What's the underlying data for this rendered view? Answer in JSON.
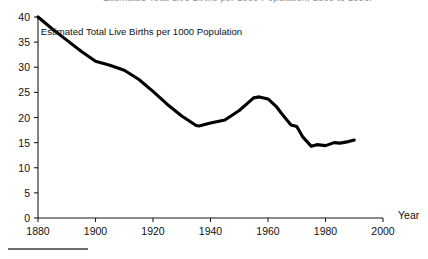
{
  "figure": {
    "clipped_title": "Estimated Total Live Births per 1000 Population, 1880 to 1990.",
    "annotation": "Estimated Total Live Births per 1000 Population",
    "x_axis_name": "Year"
  },
  "chart_data": {
    "type": "line",
    "title": "Estimated Total Live Births per 1000 Population",
    "subtitle": "",
    "xlabel": "Year",
    "ylabel": "",
    "xlim": [
      1880,
      2000
    ],
    "ylim": [
      0,
      40
    ],
    "xticks": [
      1880,
      1900,
      1920,
      1940,
      1960,
      1980,
      2000
    ],
    "yticks": [
      0,
      5,
      10,
      15,
      20,
      25,
      30,
      35,
      40
    ],
    "grid": false,
    "legend": false,
    "annotations": [
      {
        "text": "Estimated Total Live Births per 1000 Population",
        "x": 1916,
        "y": 36.5
      }
    ],
    "series": [
      {
        "name": "Estimated Total Live Births per 1000 Population",
        "color": "#000000",
        "x": [
          1880,
          1885,
          1890,
          1895,
          1900,
          1905,
          1910,
          1915,
          1920,
          1925,
          1930,
          1935,
          1936,
          1940,
          1945,
          1950,
          1955,
          1957,
          1960,
          1963,
          1965,
          1968,
          1970,
          1972,
          1975,
          1977,
          1980,
          1983,
          1985,
          1988,
          1990
        ],
        "y": [
          40.0,
          37.6,
          35.4,
          33.2,
          31.2,
          30.4,
          29.4,
          27.6,
          25.2,
          22.6,
          20.3,
          18.4,
          18.3,
          18.9,
          19.5,
          21.4,
          23.9,
          24.1,
          23.7,
          22.1,
          20.6,
          18.5,
          18.2,
          16.2,
          14.3,
          14.6,
          14.4,
          15.0,
          14.9,
          15.2,
          15.5
        ]
      }
    ]
  }
}
